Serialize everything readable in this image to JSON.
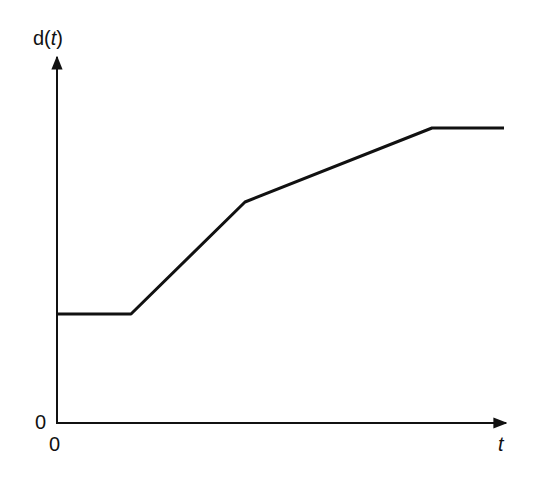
{
  "chart_data": {
    "type": "line",
    "title": "",
    "xlabel": "t",
    "ylabel": "d(t)",
    "x_origin_label": "0",
    "y_origin_label": "0",
    "grid": false,
    "legend": null,
    "series": [
      {
        "name": "d(t)",
        "points": [
          [
            0,
            109
          ],
          [
            74,
            109
          ],
          [
            188,
            221
          ],
          [
            375,
            295
          ],
          [
            447,
            295
          ]
        ],
        "description": "constant, then steep linear rise, then gentler linear rise, then constant plateau"
      }
    ],
    "xlim": [
      0,
      451
    ],
    "ylim": [
      0,
      368
    ],
    "ticks": "none (schematic; values are relative pixel units)"
  },
  "labels": {
    "ylabel_prefix": "d(",
    "ylabel_var": "t",
    "ylabel_suffix": ")",
    "xlabel": "t",
    "x_origin": "0",
    "y_origin": "0"
  },
  "style": {
    "line_color": "#111111",
    "axis_color": "#111111",
    "background": "#ffffff"
  },
  "geometry": {
    "origin_px": [
      57,
      423
    ],
    "polyline_px": "57,314 131,314 245,202 432,128 504,128"
  }
}
